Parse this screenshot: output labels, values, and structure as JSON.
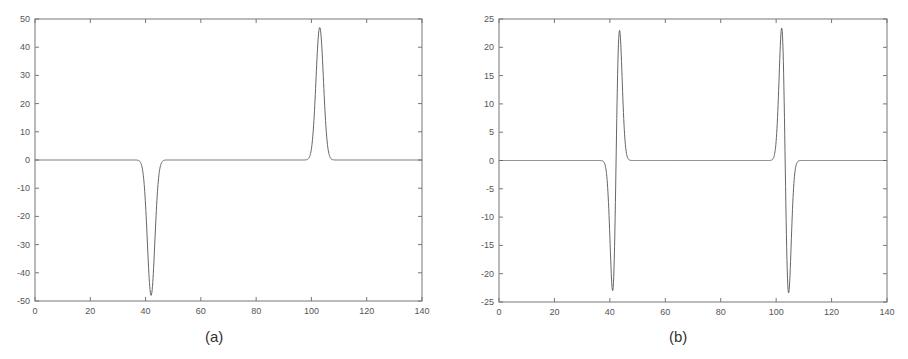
{
  "chart_data": [
    {
      "type": "line",
      "title": "",
      "caption": "(a)",
      "xlabel": "",
      "ylabel": "",
      "xlim": [
        0,
        140
      ],
      "ylim": [
        -50,
        50
      ],
      "xticks": [
        0,
        20,
        40,
        60,
        80,
        100,
        120,
        140
      ],
      "yticks": [
        50,
        40,
        30,
        20,
        10,
        0,
        -10,
        -20,
        -30,
        -40,
        -50
      ],
      "grid": false,
      "legend": null,
      "series": [
        {
          "name": "signal",
          "color": "#666666",
          "description": "Negative Gaussian pulse centered near x=42 (min about -48) and positive Gaussian pulse centered near x=103 (max about 47); zero elsewhere",
          "peaks": [
            {
              "x": 42,
              "y": -48,
              "sigma": 1.35
            },
            {
              "x": 103,
              "y": 47,
              "sigma": 1.35
            }
          ],
          "x": [
            0,
            36,
            38,
            39,
            40,
            41,
            41.5,
            42,
            42.5,
            43,
            44,
            45,
            46,
            48,
            60,
            80,
            97,
            99,
            100,
            101,
            102,
            102.5,
            103,
            103.5,
            104,
            105,
            106,
            107,
            109,
            140
          ],
          "y": [
            0,
            0,
            -0.6,
            -3,
            -11,
            -27,
            -36,
            -48,
            -36,
            -27,
            -11,
            -3,
            -0.6,
            0,
            0,
            0,
            0,
            0.6,
            3,
            11,
            30,
            38,
            47,
            38,
            30,
            11,
            3,
            0.6,
            0,
            0
          ]
        }
      ]
    },
    {
      "type": "line",
      "title": "",
      "caption": "(b)",
      "xlabel": "",
      "ylabel": "",
      "xlim": [
        0,
        140
      ],
      "ylim": [
        -25,
        25
      ],
      "xticks": [
        0,
        20,
        40,
        60,
        80,
        100,
        120,
        140
      ],
      "yticks": [
        25,
        20,
        15,
        10,
        5,
        0,
        -5,
        -10,
        -15,
        -20,
        -25
      ],
      "grid": false,
      "legend": null,
      "series": [
        {
          "name": "signal",
          "color": "#666666",
          "description": "Derivative-of-Gaussian pulses: near x=42 a dip to about -23 (x≈41) then a peak to about 23 (x≈43.5); near x=103 a peak to about 23 (x≈102) then a dip to about -23.5 (x≈104.5); zero elsewhere",
          "peaks": [
            {
              "x": 41,
              "y": -23
            },
            {
              "x": 43.5,
              "y": 23
            },
            {
              "x": 102,
              "y": 23.3
            },
            {
              "x": 104.5,
              "y": -23.5
            }
          ],
          "x": [
            0,
            36,
            38,
            39,
            40,
            41,
            41.7,
            42.3,
            43,
            43.6,
            44.5,
            45.5,
            46.5,
            48,
            60,
            80,
            97,
            98.5,
            99.5,
            100.5,
            101.3,
            102,
            102.6,
            103.3,
            104,
            104.6,
            105.5,
            106.5,
            108,
            140
          ],
          "y": [
            0,
            0,
            -0.5,
            -4,
            -14,
            -23,
            -12,
            8,
            20,
            23,
            14,
            3,
            0.3,
            0,
            0,
            0,
            0,
            0.5,
            4,
            14,
            21,
            23.3,
            12,
            -8,
            -20,
            -23.5,
            -14,
            -3,
            0,
            0
          ]
        }
      ]
    }
  ]
}
